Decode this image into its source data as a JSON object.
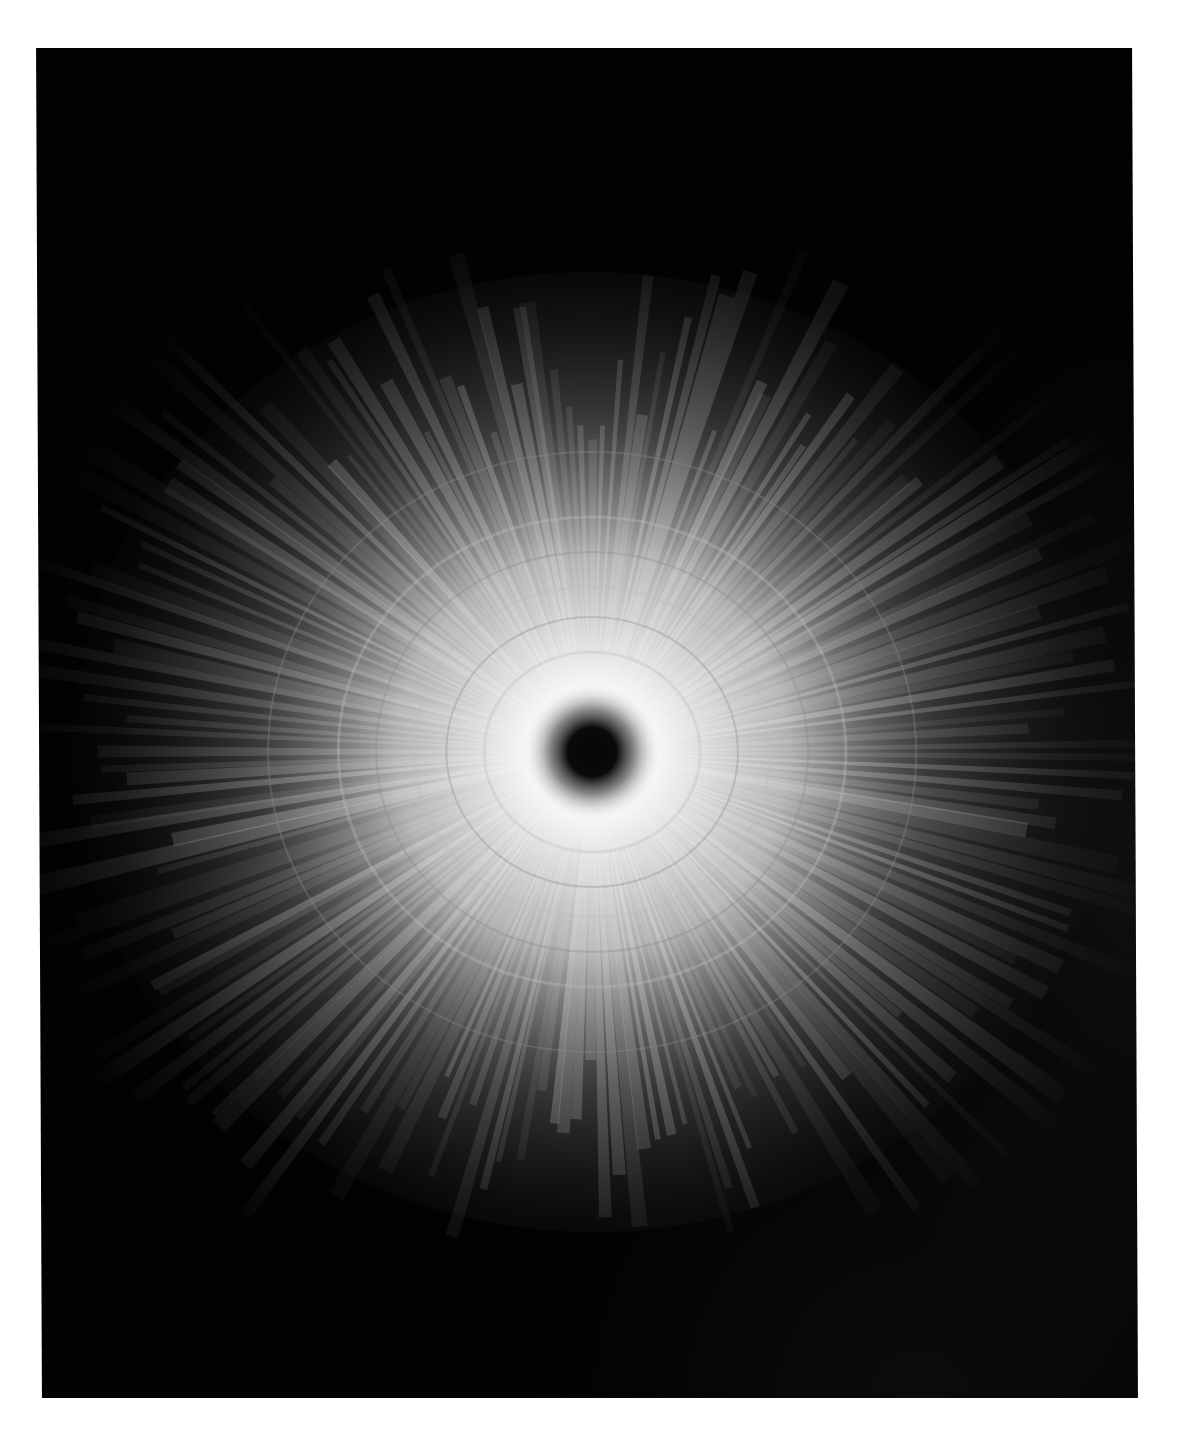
{
  "figure": {
    "kind": "radial diffraction / scattering pattern",
    "background_color": "#ffffff",
    "panel_color": "#020202",
    "panel": {
      "left": 39,
      "top": 48,
      "width": 1096,
      "height": 1350
    },
    "center": {
      "x": 553,
      "y": 704
    },
    "core": {
      "radius": 26,
      "color": "#0a0a0a"
    },
    "halo": {
      "inner_radius": 60,
      "outer_radius": 330,
      "color": "#ffffff"
    },
    "rays": {
      "count": 180,
      "length": 560,
      "color": "#ffffff"
    },
    "rings": [
      100,
      135,
      165,
      200,
      235,
      300
    ]
  }
}
